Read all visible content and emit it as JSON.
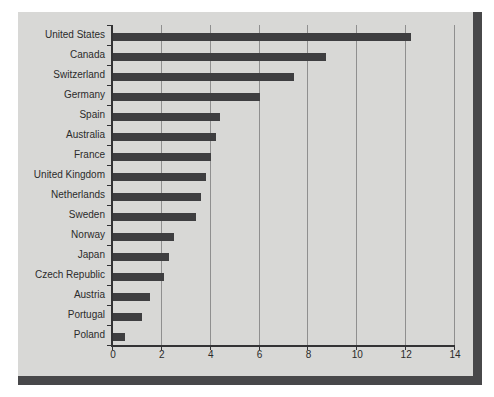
{
  "colors": {
    "page_bg": "#ffffff",
    "panel_bg": "#d8d8d6",
    "panel_edge": "#48484a",
    "bar": "#3e3e40",
    "gridline": "#8f8f8f",
    "axis": "#333335",
    "text": "#2b2b2b"
  },
  "chart_data": {
    "type": "bar",
    "orientation": "horizontal",
    "title": "",
    "xlabel": "",
    "ylabel": "",
    "categories": [
      "United States",
      "Canada",
      "Switzerland",
      "Germany",
      "Spain",
      "Australia",
      "France",
      "United Kingdom",
      "Netherlands",
      "Sweden",
      "Norway",
      "Japan",
      "Czech Republic",
      "Austria",
      "Portugal",
      "Poland"
    ],
    "values": [
      12.2,
      8.7,
      7.4,
      6.0,
      4.4,
      4.2,
      4.0,
      3.8,
      3.6,
      3.4,
      2.5,
      2.3,
      2.1,
      1.5,
      1.2,
      0.5
    ],
    "xlim": [
      0,
      14
    ],
    "xticks": [
      0,
      2,
      4,
      6,
      8,
      10,
      12,
      14
    ],
    "grid": "vertical",
    "legend": "none",
    "bar_color": "#3e3e40"
  }
}
